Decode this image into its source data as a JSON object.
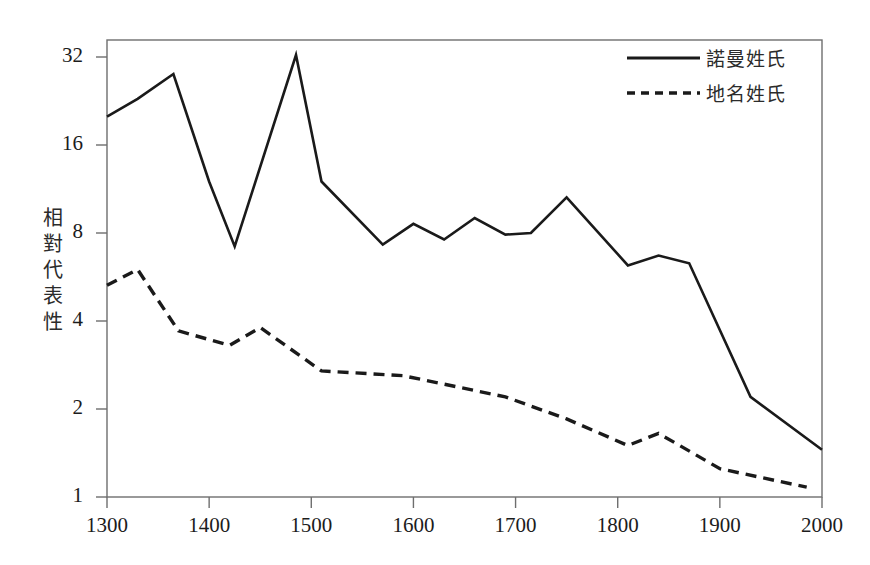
{
  "chart_data": {
    "type": "line",
    "title": "",
    "subtitle": "",
    "xlabel": "",
    "ylabel": "相對代表性",
    "xlim": [
      1300,
      2000
    ],
    "ylim": [
      1,
      36
    ],
    "yscale": "log2",
    "grid": false,
    "legend_position": "top-right",
    "x_ticks": [
      "1300",
      "1400",
      "1500",
      "1600",
      "1700",
      "1800",
      "1900",
      "2000"
    ],
    "y_ticks": [
      "1",
      "2",
      "4",
      "8",
      "16",
      "32"
    ],
    "series": [
      {
        "name": "諾曼姓氏",
        "style": "solid",
        "color": "#1a1a1a",
        "x": [
          1300,
          1330,
          1365,
          1400,
          1425,
          1485,
          1510,
          1570,
          1600,
          1630,
          1660,
          1690,
          1715,
          1750,
          1810,
          1840,
          1870,
          1930,
          2000
        ],
        "values": [
          20.0,
          23.0,
          28.0,
          12.0,
          7.2,
          32.5,
          12.0,
          7.3,
          8.6,
          7.6,
          9.0,
          7.9,
          8.0,
          10.6,
          6.2,
          6.7,
          6.3,
          2.2,
          1.45
        ]
      },
      {
        "name": "地名姓氏",
        "style": "dashed",
        "color": "#1a1a1a",
        "x": [
          1300,
          1330,
          1370,
          1420,
          1450,
          1510,
          1590,
          1690,
          1750,
          1810,
          1840,
          1900,
          1985
        ],
        "values": [
          5.3,
          6.0,
          3.7,
          3.3,
          3.8,
          2.7,
          2.6,
          2.2,
          1.85,
          1.5,
          1.65,
          1.25,
          1.08
        ]
      }
    ]
  },
  "legend": {
    "items": [
      {
        "label": "諾曼姓氏",
        "style": "solid"
      },
      {
        "label": "地名姓氏",
        "style": "dashed"
      }
    ]
  },
  "axis": {
    "y_title": "相對代表性"
  }
}
